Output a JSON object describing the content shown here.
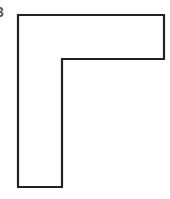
{
  "figure": {
    "label": "3",
    "shape": "L-shape",
    "stroke_color": "#222222",
    "background": "#ffffff",
    "points": "18,15 164,15 164,59 62,59 62,187 18,187"
  }
}
